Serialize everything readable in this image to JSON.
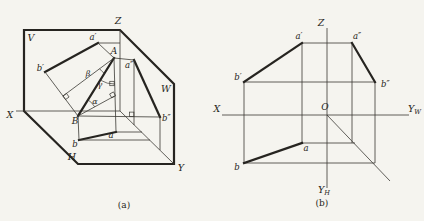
{
  "palette": {
    "ink": "#2e2c27",
    "heavy_ink": "#262420",
    "paper": "#f5f4ef"
  },
  "figure_a": {
    "outline": "M24,30 L120,30 L174,84 L174,164 L78,164 L24,111 Z",
    "segments": [
      {
        "name": "z-axis-edge",
        "x1": 120,
        "y1": 30,
        "x2": 120,
        "y2": 111,
        "w": "thin"
      },
      {
        "name": "x-axis-edge",
        "x1": 16,
        "y1": 111,
        "x2": 120,
        "y2": 111,
        "w": "thin"
      },
      {
        "name": "y-axis-edge",
        "x1": 120,
        "y1": 111,
        "x2": 174,
        "y2": 164,
        "w": "thin"
      },
      {
        "name": "projection-a-prime-b-prime",
        "x1": 98,
        "y1": 43,
        "x2": 45,
        "y2": 72,
        "w": "heavy"
      },
      {
        "name": "line-AB",
        "x1": 114,
        "y1": 58,
        "x2": 78,
        "y2": 116,
        "w": "heavy"
      },
      {
        "name": "projection-ab",
        "x1": 79,
        "y1": 140,
        "x2": 116,
        "y2": 132,
        "w": "heavy"
      },
      {
        "name": "projection-a-dblprime-b-dblprime",
        "x1": 134,
        "y1": 60,
        "x2": 160,
        "y2": 117,
        "w": "heavy"
      },
      {
        "name": "projector-a-prime-A",
        "x1": 98,
        "y1": 43,
        "x2": 114,
        "y2": 58,
        "w": "thin"
      },
      {
        "name": "projector-b-prime-B",
        "x1": 45,
        "y1": 72,
        "x2": 78,
        "y2": 116,
        "w": "thin"
      },
      {
        "name": "projector-A-a",
        "x1": 114,
        "y1": 58,
        "x2": 116,
        "y2": 132,
        "w": "thin"
      },
      {
        "name": "projector-B-b",
        "x1": 78,
        "y1": 116,
        "x2": 79,
        "y2": 140,
        "w": "thin"
      },
      {
        "name": "projector-A-a-dblprime",
        "x1": 114,
        "y1": 58,
        "x2": 134,
        "y2": 60,
        "w": "thin"
      },
      {
        "name": "projector-B-b-dblprime",
        "x1": 78,
        "y1": 116,
        "x2": 160,
        "y2": 117,
        "w": "thin"
      },
      {
        "name": "trace-a-prime-to-z",
        "x1": 98,
        "y1": 43,
        "x2": 120,
        "y2": 43,
        "w": "thin"
      },
      {
        "name": "trace-a-dblprime-to-y",
        "x1": 134,
        "y1": 60,
        "x2": 134,
        "y2": 125,
        "w": "thin"
      },
      {
        "name": "trace-a-to-y",
        "x1": 116,
        "y1": 132,
        "x2": 142,
        "y2": 132,
        "w": "thin"
      },
      {
        "name": "trace-b-to-y",
        "x1": 79,
        "y1": 140,
        "x2": 150,
        "y2": 140,
        "w": "thin"
      },
      {
        "name": "trace-b-dblprime-to-y",
        "x1": 160,
        "y1": 117,
        "x2": 160,
        "y2": 150,
        "w": "thin"
      },
      {
        "name": "aux-perpendicular-from-A",
        "x1": 114,
        "y1": 58,
        "x2": 63,
        "y2": 96,
        "w": "thin"
      },
      {
        "name": "aux-perpendicular-from-B",
        "x1": 78,
        "y1": 116,
        "x2": 114.5,
        "y2": 96,
        "w": "thin"
      }
    ],
    "arcs": [
      {
        "name": "angle-alpha-arc",
        "d": "M88,99.9 A19,19 0 0 1 94.7,106.9"
      },
      {
        "name": "angle-beta-arc",
        "d": "M104.5,73.3 A18,18 0 0 1 99.6,68.7"
      },
      {
        "name": "angle-gamma-arc",
        "d": "M114.7,84 A26,26 0 0 1 100.3,80.1"
      }
    ],
    "squares": [
      {
        "name": "right-angle-mark-s1",
        "cx": 66,
        "cy": 96.5,
        "s": 4.4,
        "rot": 54
      },
      {
        "name": "right-angle-mark-s2",
        "cx": 112.6,
        "cy": 94.9,
        "s": 4.4,
        "rot": -29
      },
      {
        "name": "right-angle-mark-s3",
        "cx": 112,
        "cy": 83.5,
        "s": 4.4,
        "rot": 0
      },
      {
        "name": "right-angle-mark-s4",
        "cx": 131.7,
        "cy": 114.3,
        "s": 4.4,
        "rot": 0
      }
    ],
    "labels": [
      {
        "name": "label-plane-V",
        "text": "V",
        "x": 31,
        "y": 41,
        "anchor": "middle",
        "size": 9.5
      },
      {
        "name": "label-plane-H",
        "text": "H",
        "x": 72,
        "y": 160,
        "anchor": "middle",
        "size": 9.5
      },
      {
        "name": "label-plane-W",
        "text": "W",
        "x": 166,
        "y": 92,
        "anchor": "middle",
        "size": 9.5
      },
      {
        "name": "label-axis-X",
        "text": "X",
        "x": 10,
        "y": 118,
        "anchor": "middle",
        "size": 9.5
      },
      {
        "name": "label-axis-Y",
        "text": "Y",
        "x": 181,
        "y": 171,
        "anchor": "middle",
        "size": 9.5
      },
      {
        "name": "label-axis-Z",
        "text": "Z",
        "x": 118,
        "y": 24,
        "anchor": "middle",
        "size": 9.5
      },
      {
        "name": "label-point-A",
        "text": "A",
        "x": 114,
        "y": 54,
        "anchor": "middle",
        "size": 9
      },
      {
        "name": "label-point-B",
        "text": "B",
        "x": 75,
        "y": 124,
        "anchor": "middle",
        "size": 9
      },
      {
        "name": "label-point-a-prime",
        "text": "a′",
        "x": 93,
        "y": 40,
        "anchor": "middle",
        "size": 8.5
      },
      {
        "name": "label-point-b-prime",
        "text": "b′",
        "x": 44,
        "y": 71,
        "anchor": "end",
        "size": 8.5
      },
      {
        "name": "label-point-a-dblprime",
        "text": "a″",
        "x": 125,
        "y": 68,
        "anchor": "start",
        "size": 8.5
      },
      {
        "name": "label-point-b-dblprime",
        "text": "b″",
        "x": 162,
        "y": 121,
        "anchor": "start",
        "size": 8.5
      },
      {
        "name": "label-point-a",
        "text": "a",
        "x": 111,
        "y": 138,
        "anchor": "middle",
        "size": 8.5
      },
      {
        "name": "label-point-b",
        "text": "b",
        "x": 75,
        "y": 147,
        "anchor": "middle",
        "size": 8.5
      },
      {
        "name": "label-angle-alpha",
        "text": "α",
        "x": 95,
        "y": 104,
        "anchor": "middle",
        "size": 8
      },
      {
        "name": "label-angle-beta",
        "text": "β",
        "x": 88,
        "y": 76,
        "anchor": "middle",
        "size": 8
      },
      {
        "name": "label-angle-gamma",
        "text": "γ",
        "x": 100,
        "y": 87,
        "anchor": "middle",
        "size": 8
      },
      {
        "name": "caption-a",
        "text": "(a)",
        "x": 124,
        "y": 208,
        "anchor": "middle",
        "size": 9,
        "upright": true
      }
    ]
  },
  "figure_b": {
    "segments": [
      {
        "name": "z-axis",
        "x1": 327,
        "y1": 28,
        "x2": 327,
        "y2": 188,
        "w": "thin"
      },
      {
        "name": "x-yw-axis",
        "x1": 222,
        "y1": 115,
        "x2": 409,
        "y2": 115,
        "w": "thin"
      },
      {
        "name": "miter-45-line",
        "x1": 327,
        "y1": 115,
        "x2": 390,
        "y2": 181,
        "w": "thin"
      },
      {
        "name": "connector-a-prime-a",
        "x1": 302,
        "y1": 43,
        "x2": 302,
        "y2": 143,
        "w": "thin"
      },
      {
        "name": "connector-b-prime-b",
        "x1": 244,
        "y1": 82,
        "x2": 244,
        "y2": 163,
        "w": "thin"
      },
      {
        "name": "connector-a-prime-a-dblprime",
        "x1": 302,
        "y1": 43,
        "x2": 352,
        "y2": 43,
        "w": "thin"
      },
      {
        "name": "connector-b-prime-b-dblprime",
        "x1": 244,
        "y1": 82,
        "x2": 375,
        "y2": 82,
        "w": "thin"
      },
      {
        "name": "transfer-a-horizontal",
        "x1": 302,
        "y1": 143,
        "x2": 355,
        "y2": 143,
        "w": "thin"
      },
      {
        "name": "transfer-b-horizontal",
        "x1": 244,
        "y1": 163,
        "x2": 375,
        "y2": 163,
        "w": "thin"
      },
      {
        "name": "transfer-a-dblprime-vertical",
        "x1": 352,
        "y1": 43,
        "x2": 352,
        "y2": 143,
        "w": "thin"
      },
      {
        "name": "transfer-b-dblprime-vertical",
        "x1": 375,
        "y1": 82,
        "x2": 375,
        "y2": 163,
        "w": "thin"
      },
      {
        "name": "projection-b-prime-a-prime",
        "x1": 244,
        "y1": 82,
        "x2": 302,
        "y2": 43,
        "w": "heavy"
      },
      {
        "name": "projection-a-dblprime-b-dblprime",
        "x1": 352,
        "y1": 43,
        "x2": 375,
        "y2": 82,
        "w": "heavy"
      },
      {
        "name": "projection-ba",
        "x1": 244,
        "y1": 163,
        "x2": 302,
        "y2": 143,
        "w": "heavy"
      }
    ],
    "arcs": [],
    "squares": [],
    "labels": [
      {
        "name": "label-axis-Z",
        "text": "Z",
        "x": 321,
        "y": 26,
        "anchor": "middle",
        "size": 9.5
      },
      {
        "name": "label-axis-X",
        "text": "X",
        "x": 217,
        "y": 112,
        "anchor": "middle",
        "size": 9.5
      },
      {
        "name": "label-origin-O",
        "text": "O",
        "x": 325,
        "y": 110,
        "anchor": "middle",
        "size": 9
      },
      {
        "name": "label-axis-Yw",
        "text": "Y",
        "sub": "W",
        "x": 408,
        "y": 112,
        "anchor": "start",
        "size": 9.5
      },
      {
        "name": "label-axis-Yh",
        "text": "Y",
        "sub": "H",
        "x": 318,
        "y": 193,
        "anchor": "start",
        "size": 9.5
      },
      {
        "name": "label-point-a-prime",
        "text": "a′",
        "x": 299,
        "y": 39,
        "anchor": "middle",
        "size": 8.5
      },
      {
        "name": "label-point-a-dblprime",
        "text": "a″",
        "x": 357,
        "y": 39,
        "anchor": "middle",
        "size": 8.5
      },
      {
        "name": "label-point-b-prime",
        "text": "b′",
        "x": 238,
        "y": 80,
        "anchor": "middle",
        "size": 8.5
      },
      {
        "name": "label-point-b-dblprime",
        "text": "b″",
        "x": 381,
        "y": 87,
        "anchor": "start",
        "size": 8.5
      },
      {
        "name": "label-point-a",
        "text": "a",
        "x": 306,
        "y": 151,
        "anchor": "middle",
        "size": 8.5
      },
      {
        "name": "label-point-b",
        "text": "b",
        "x": 237,
        "y": 170,
        "anchor": "middle",
        "size": 8.5
      },
      {
        "name": "caption-b",
        "text": "(b)",
        "x": 322,
        "y": 206,
        "anchor": "middle",
        "size": 9,
        "upright": true
      }
    ]
  }
}
